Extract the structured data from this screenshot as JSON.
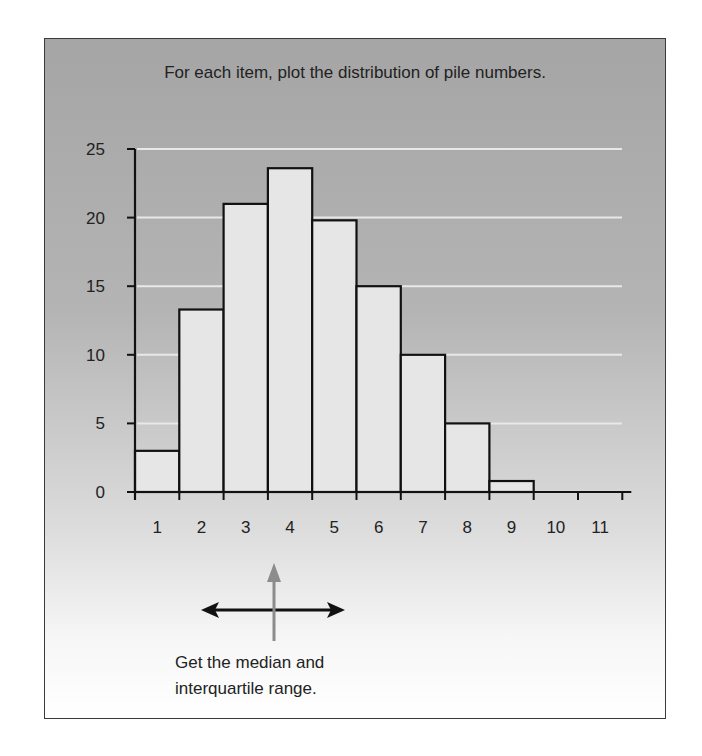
{
  "title": "For each item, plot the distribution of pile numbers.",
  "note": {
    "line1": "Get the median and",
    "line2": "interquartile range."
  },
  "colors": {
    "bar_fill": "#e6e6e6",
    "bar_stroke": "#111111",
    "gridline": "#e8e8e8",
    "arrow_vertical": "#8c8c8c",
    "arrow_horizontal": "#111111"
  },
  "chart_data": {
    "type": "bar",
    "title": "For each item, plot the distribution of pile numbers.",
    "xlabel": "",
    "ylabel": "",
    "categories": [
      "1",
      "2",
      "3",
      "4",
      "5",
      "6",
      "7",
      "8",
      "9",
      "10",
      "11"
    ],
    "values": [
      3,
      13.3,
      21,
      23.6,
      19.8,
      15,
      10,
      5,
      0.8,
      0,
      0
    ],
    "yticks": [
      0,
      5,
      10,
      15,
      20,
      25
    ],
    "ylim": [
      0,
      25
    ],
    "grid": true,
    "legend": "none",
    "annotations": [
      "Vertical arrow pointing up at bin 4 (median)",
      "Horizontal double-headed arrow spanning approx. bins 2-5 (interquartile range)",
      "Get the median and interquartile range."
    ]
  }
}
